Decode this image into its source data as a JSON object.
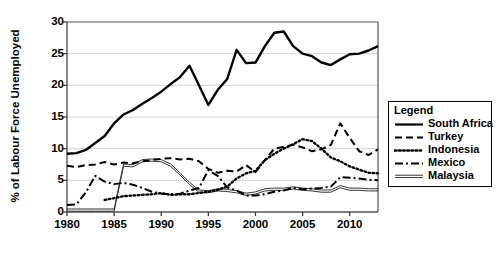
{
  "chart_data": {
    "type": "line",
    "title": "",
    "xlabel": "",
    "ylabel": "% of Labour Force Unemployed",
    "xlim": [
      1980,
      2013
    ],
    "ylim": [
      0,
      30
    ],
    "ytick_values": [
      0,
      5,
      10,
      15,
      20,
      25,
      30
    ],
    "ytick_labels": [
      "0",
      "5",
      "10",
      "15",
      "20",
      "25",
      "30"
    ],
    "xtick_values": [
      1980,
      1985,
      1990,
      1995,
      2000,
      2005,
      2010
    ],
    "xtick_labels": [
      "1980",
      "1985",
      "1990",
      "1995",
      "2000",
      "2005",
      "2010"
    ],
    "grid": "horizontal",
    "legend_position": "right-outside",
    "legend_title": "Legend",
    "x": [
      1980,
      1981,
      1982,
      1983,
      1984,
      1985,
      1986,
      1987,
      1988,
      1989,
      1990,
      1991,
      1992,
      1993,
      1994,
      1995,
      1996,
      1997,
      1998,
      1999,
      2000,
      2001,
      2002,
      2003,
      2004,
      2005,
      2006,
      2007,
      2008,
      2009,
      2010,
      2011,
      2012,
      2013
    ],
    "series": [
      {
        "name": "South Africa",
        "style": "solid",
        "color": "#000000",
        "values": [
          9.2,
          9.3,
          9.8,
          10.9,
          12.0,
          14.0,
          15.4,
          16.1,
          17.1,
          18.0,
          19.0,
          20.2,
          21.3,
          23.1,
          20.0,
          16.9,
          19.3,
          21.0,
          25.6,
          23.5,
          23.6,
          26.2,
          28.3,
          28.5,
          26.2,
          25.0,
          24.6,
          23.6,
          23.2,
          24.1,
          24.9,
          25.0,
          25.5,
          26.2
        ]
      },
      {
        "name": "Turkey",
        "style": "dashed",
        "color": "#000000",
        "values": [
          7.3,
          7.1,
          7.4,
          7.5,
          7.9,
          7.5,
          7.8,
          7.7,
          8.0,
          8.2,
          8.4,
          8.5,
          8.3,
          8.4,
          8.0,
          6.8,
          6.2,
          6.5,
          6.4,
          7.4,
          6.3,
          8.2,
          10.0,
          10.3,
          10.6,
          10.2,
          9.6,
          9.9,
          10.6,
          14.0,
          11.7,
          9.6,
          9.0,
          9.9
        ]
      },
      {
        "name": "Indonesia",
        "style": "dotted",
        "color": "#000000",
        "values": [
          null,
          null,
          null,
          null,
          1.9,
          2.2,
          2.5,
          2.6,
          2.7,
          2.8,
          3.0,
          2.7,
          2.8,
          2.8,
          3.0,
          3.2,
          3.5,
          4.0,
          5.3,
          6.1,
          6.5,
          8.2,
          9.2,
          10.0,
          10.7,
          11.5,
          11.2,
          10.0,
          8.6,
          8.0,
          7.2,
          6.7,
          6.2,
          6.1
        ]
      },
      {
        "name": "Mexico",
        "style": "dashdot",
        "color": "#000000",
        "values": [
          1.1,
          1.2,
          3.1,
          5.7,
          4.8,
          4.4,
          4.6,
          4.3,
          3.8,
          3.2,
          2.9,
          2.8,
          2.9,
          3.4,
          3.8,
          6.6,
          5.7,
          3.9,
          3.4,
          2.6,
          2.6,
          2.8,
          3.2,
          3.4,
          3.8,
          3.6,
          3.7,
          3.8,
          4.0,
          5.5,
          5.4,
          5.3,
          5.1,
          5.0
        ]
      },
      {
        "name": "Malaysia",
        "style": "double",
        "color": "#333333",
        "values": [
          0.3,
          0.3,
          0.3,
          0.3,
          0.3,
          0.3,
          7.4,
          7.3,
          8.1,
          8.2,
          8.1,
          7.4,
          6.0,
          4.5,
          3.3,
          3.2,
          3.5,
          3.4,
          3.2,
          2.8,
          3.0,
          3.5,
          3.6,
          3.6,
          3.8,
          3.6,
          3.5,
          3.3,
          3.3,
          4.0,
          3.6,
          3.6,
          3.5,
          3.5
        ]
      }
    ]
  },
  "legend": {
    "title": "Legend",
    "items": [
      {
        "label": "South Africa",
        "style": "solid"
      },
      {
        "label": "Turkey",
        "style": "dashed"
      },
      {
        "label": "Indonesia",
        "style": "dotted"
      },
      {
        "label": "Mexico",
        "style": "dashdot"
      },
      {
        "label": "Malaysia",
        "style": "double"
      }
    ]
  },
  "axes": {
    "ylabel": "% of Labour Force Unemployed",
    "ytick_labels": [
      "0",
      "5",
      "10",
      "15",
      "20",
      "25",
      "30"
    ],
    "xtick_labels": [
      "1980",
      "1985",
      "1990",
      "1995",
      "2000",
      "2005",
      "2010"
    ]
  }
}
